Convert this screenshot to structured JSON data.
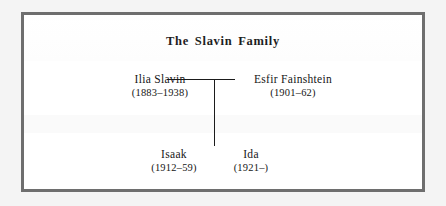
{
  "figure": {
    "title": "The Slavin Family",
    "frame_color": "#6e6e6e",
    "background_color": "#ffffff",
    "page_background_color": "#f4f4f4",
    "text_color": "#161616",
    "line_color": "#1b1b1b"
  },
  "chart_data": {
    "type": "diagram",
    "diagram_kind": "family-tree",
    "title": "The Slavin Family",
    "generations": [
      {
        "label": "parents",
        "people": [
          {
            "name": "Ilia Slavin",
            "dates": "(1883–1938)",
            "birth": 1883,
            "death": 1938
          },
          {
            "name": "Esfir Fainshtein",
            "dates": "(1901–62)",
            "birth": 1901,
            "death": 1962
          }
        ]
      },
      {
        "label": "children",
        "people": [
          {
            "name": "Isaak",
            "dates": "(1912–59)",
            "birth": 1912,
            "death": 1959
          },
          {
            "name": "Ida",
            "dates": "(1921–)",
            "birth": 1921,
            "death": null
          }
        ]
      }
    ],
    "relationships": [
      {
        "kind": "marriage",
        "between": [
          "Ilia Slavin",
          "Esfir Fainshtein"
        ]
      },
      {
        "kind": "descent",
        "from": [
          "Ilia Slavin",
          "Esfir Fainshtein"
        ],
        "to": [
          "Isaak",
          "Ida"
        ]
      }
    ]
  },
  "people": {
    "father": {
      "name": "Ilia Slavin",
      "dates": "(1883–1938)"
    },
    "mother": {
      "name": "Esfir Fainshtein",
      "dates": "(1901–62)"
    },
    "child1": {
      "name": "Isaak",
      "dates": "(1912–59)"
    },
    "child2": {
      "name": "Ida",
      "dates": "(1921–)"
    }
  }
}
